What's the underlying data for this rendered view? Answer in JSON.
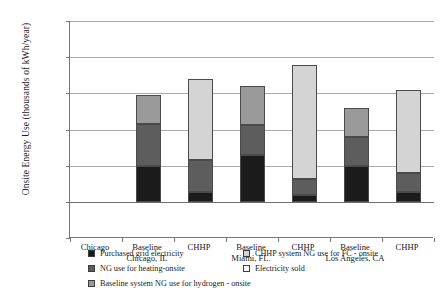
{
  "chart_data": {
    "type": "bar",
    "stacked": true,
    "title": "",
    "xlabel": "",
    "ylabel": "Onsite Energy Use (thousands of kWh/year)",
    "ylim": [
      -5000,
      25000
    ],
    "ytick_values": [
      25000,
      20000,
      15000,
      10000,
      5000,
      0,
      -5000
    ],
    "ytick_labels": [
      "25,000",
      "20,000",
      "15,000",
      "10,000",
      "5,000",
      "0",
      "-5,000"
    ],
    "grid": true,
    "legend_position": "bottom",
    "categories": [
      "Chicago",
      "Baseline Chicago, IL",
      "CHHP",
      "Baseline Miami, FL",
      "CHHP",
      "Baseline Los Angeles, CA",
      "CHHP"
    ],
    "series": [
      {
        "name": "Purchased grid electricity",
        "key": "purchased_grid_electricity",
        "color": "#1b1b1b",
        "values": [
          0,
          5000,
          1300,
          6500,
          1000,
          5000,
          1300
        ]
      },
      {
        "name": "NG use for heating-onsite",
        "key": "ng_heating_onsite",
        "color": "#5d5d5d",
        "values": [
          0,
          5700,
          4500,
          4100,
          2100,
          4000,
          2700
        ]
      },
      {
        "name": "Baseline system NG use for hydrogen - onsite",
        "key": "baseline_ng_hydrogen_onsite",
        "color": "#9a9a9a",
        "values": [
          0,
          4100,
          0,
          5400,
          0,
          4000,
          0
        ]
      },
      {
        "name": "CHHP system NG use for FC - onsite",
        "key": "chhp_ng_fc_onsite",
        "color": "#d4d4d4",
        "values": [
          0,
          0,
          11200,
          0,
          15800,
          0,
          11400
        ]
      },
      {
        "name": "Electricity sold",
        "key": "electricity_sold",
        "color": "#ffffff",
        "values": [
          0,
          0,
          0,
          0,
          0,
          0,
          0
        ]
      }
    ],
    "bar_totals": [
      0,
      14800,
      17000,
      16000,
      18900,
      13000,
      15400
    ],
    "annotations": []
  },
  "axis": {
    "y_title": "Onsite Energy Use (thousands of kWh/year)",
    "ticks": [
      {
        "label": "25,000",
        "value": 25000
      },
      {
        "label": "20,000",
        "value": 20000
      },
      {
        "label": "15,000",
        "value": 15000
      },
      {
        "label": "10,000",
        "value": 10000
      },
      {
        "label": "5,000",
        "value": 5000
      },
      {
        "label": "0",
        "value": 0
      },
      {
        "label": "-5,000",
        "value": -5000
      }
    ]
  },
  "x_labels": [
    {
      "line1": "Chicago",
      "line2": ""
    },
    {
      "line1": "Baseline",
      "line2": "Chicago, IL"
    },
    {
      "line1": "CHHP",
      "line2": ""
    },
    {
      "line1": "Baseline",
      "line2": "Miami, FL."
    },
    {
      "line1": "CHHP",
      "line2": ""
    },
    {
      "line1": "Baseline",
      "line2": "Los Angeles, CA"
    },
    {
      "line1": "CHHP",
      "line2": ""
    }
  ],
  "legend": {
    "left_column": [
      {
        "label": "Purchased grid electricity",
        "color": "#1b1b1b"
      },
      {
        "label": "NG use for heating-onsite",
        "color": "#5d5d5d"
      },
      {
        "label": "Baseline system NG use for hydrogen - onsite",
        "color": "#9a9a9a"
      }
    ],
    "right_column": [
      {
        "label": "CHHP system NG use for FC - onsite",
        "color": "#d4d4d4"
      },
      {
        "label": "Electricity sold",
        "color": "#ffffff"
      }
    ]
  }
}
